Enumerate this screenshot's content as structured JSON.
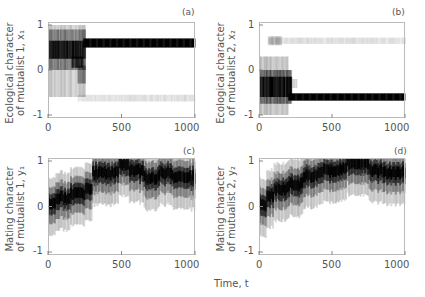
{
  "figure": {
    "xaxis_title": "Time, t"
  },
  "chart_data": [
    {
      "id": "a",
      "type": "heatmap",
      "panel_label": "(a)",
      "ylabel_line1": "Ecological character",
      "ylabel_line2": "of mutualist 1, x₁",
      "xlabel": "",
      "xlim": [
        0,
        1000
      ],
      "ylim": [
        -1,
        1
      ],
      "xticks": [
        "0",
        "500",
        "1000"
      ],
      "yticks": [
        "1",
        "0",
        "-1"
      ],
      "description": "Population density of trait x1 over time; broad distribution around 0-0.8 until t~250, then converges to a dense band at ~0.6 with a faint band near -0.6",
      "bands": [
        {
          "t0": 0,
          "t1": 250,
          "y0": -0.6,
          "y1": 1.0,
          "alpha": 0.18
        },
        {
          "t0": 0,
          "t1": 250,
          "y0": 0.0,
          "y1": 0.9,
          "alpha": 0.35
        },
        {
          "t0": 0,
          "t1": 250,
          "y0": 0.25,
          "y1": 0.65,
          "alpha": 0.8
        },
        {
          "t0": 160,
          "t1": 240,
          "y0": 0.05,
          "y1": 0.3,
          "alpha": 0.7
        },
        {
          "t0": 200,
          "t1": 250,
          "y0": -0.3,
          "y1": 0.1,
          "alpha": 0.3
        },
        {
          "t0": 240,
          "t1": 1000,
          "y0": 0.5,
          "y1": 0.7,
          "alpha": 1.0
        },
        {
          "t0": 200,
          "t1": 1000,
          "y0": -0.7,
          "y1": -0.55,
          "alpha": 0.1
        }
      ]
    },
    {
      "id": "b",
      "type": "heatmap",
      "panel_label": "(b)",
      "ylabel_line1": "Ecological character",
      "ylabel_line2": "of mutualist 2, x₂",
      "xlabel": "",
      "xlim": [
        0,
        1000
      ],
      "ylim": [
        -1,
        1
      ],
      "xticks": [
        "0",
        "500",
        "1000"
      ],
      "yticks": [
        "1",
        "0",
        "-1"
      ],
      "description": "Population density of trait x2 over time; broad distribution around -0.5 until t~220, then converges to a dense band at ~-0.6 with a faint band near 0.65",
      "bands": [
        {
          "t0": 0,
          "t1": 200,
          "y0": -1.0,
          "y1": 0.3,
          "alpha": 0.2
        },
        {
          "t0": 0,
          "t1": 220,
          "y0": -0.75,
          "y1": 0.0,
          "alpha": 0.45
        },
        {
          "t0": 0,
          "t1": 220,
          "y0": -0.6,
          "y1": -0.15,
          "alpha": 0.85
        },
        {
          "t0": 220,
          "t1": 260,
          "y0": -0.4,
          "y1": -0.2,
          "alpha": 0.15
        },
        {
          "t0": 200,
          "t1": 1000,
          "y0": -0.68,
          "y1": -0.52,
          "alpha": 1.0
        },
        {
          "t0": 60,
          "t1": 1000,
          "y0": 0.58,
          "y1": 0.72,
          "alpha": 0.1
        },
        {
          "t0": 60,
          "t1": 150,
          "y0": 0.55,
          "y1": 0.75,
          "alpha": 0.2
        }
      ]
    },
    {
      "id": "c",
      "type": "heatmap",
      "panel_label": "(c)",
      "ylabel_line1": "Mating character",
      "ylabel_line2": "of mutualist 1, y₁",
      "xlabel": "",
      "xlim": [
        0,
        1000
      ],
      "ylim": [
        -1,
        1
      ],
      "xticks": [
        "0",
        "500",
        "1000"
      ],
      "yticks": [
        "1",
        "0",
        "-1"
      ],
      "description": "Population density of trait y1 over time; starts near 0, drifts upward to ~0.8 by t~300, then fluctuates between 0.6 and 1.0",
      "mean_path": [
        {
          "t": 0,
          "y": 0.05
        },
        {
          "t": 50,
          "y": 0.2
        },
        {
          "t": 150,
          "y": 0.3
        },
        {
          "t": 250,
          "y": 0.4
        },
        {
          "t": 300,
          "y": 0.75
        },
        {
          "t": 450,
          "y": 0.8
        },
        {
          "t": 480,
          "y": 0.95
        },
        {
          "t": 550,
          "y": 0.8
        },
        {
          "t": 650,
          "y": 0.65
        },
        {
          "t": 750,
          "y": 0.75
        },
        {
          "t": 850,
          "y": 0.65
        },
        {
          "t": 1000,
          "y": 0.6
        }
      ]
    },
    {
      "id": "d",
      "type": "heatmap",
      "panel_label": "(d)",
      "ylabel_line1": "Mating character",
      "ylabel_line2": "of mutualist 2, y₂",
      "xlabel": "Time, t",
      "xlim": [
        0,
        1000
      ],
      "ylim": [
        -1,
        1
      ],
      "xticks": [
        "0",
        "500",
        "1000"
      ],
      "yticks": [
        "1",
        "0",
        "-1"
      ],
      "description": "Population density of trait y2 over time; starts near 0, rises to ~0.8 by t~300, reaches ~1.0 around t=550-650, then fluctuates 0.7-0.9",
      "mean_path": [
        {
          "t": 0,
          "y": 0.05
        },
        {
          "t": 50,
          "y": 0.25
        },
        {
          "t": 100,
          "y": 0.4
        },
        {
          "t": 200,
          "y": 0.5
        },
        {
          "t": 300,
          "y": 0.7
        },
        {
          "t": 400,
          "y": 0.8
        },
        {
          "t": 550,
          "y": 0.85
        },
        {
          "t": 600,
          "y": 0.97
        },
        {
          "t": 680,
          "y": 0.95
        },
        {
          "t": 750,
          "y": 0.8
        },
        {
          "t": 850,
          "y": 0.75
        },
        {
          "t": 1000,
          "y": 0.8
        }
      ]
    }
  ]
}
